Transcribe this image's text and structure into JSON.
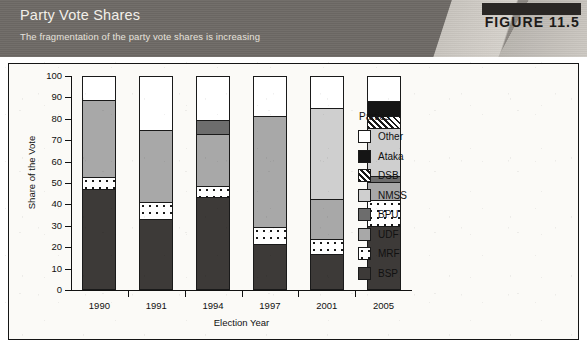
{
  "header": {
    "title": "Party Vote Shares",
    "subtitle": "The fragmentation of the party vote shares is increasing",
    "figure_label": "FIGURE 11.5",
    "band_color": "#6e6a66",
    "badge_color": "#2a2725"
  },
  "chart_data": {
    "type": "bar",
    "subtype": "stacked-bar-100",
    "title": "Party Vote Shares",
    "subtitle": "The fragmentation of the party vote shares is increasing",
    "xlabel": "Election Year",
    "ylabel": "Share of the Vote",
    "categories": [
      "1990",
      "1991",
      "1994",
      "1997",
      "2001",
      "2005"
    ],
    "ylim": [
      0,
      100
    ],
    "yticks": [
      0,
      10,
      20,
      30,
      40,
      50,
      60,
      70,
      80,
      90,
      100
    ],
    "grid": false,
    "legend_position": "right",
    "legend_title": "Parties",
    "stack_order_bottom_to_top": [
      "BSP",
      "MRF",
      "UDF",
      "BPU",
      "NMSS",
      "DSB",
      "Ataka",
      "Other"
    ],
    "series": [
      {
        "name": "BSP",
        "fill": "solid-dark-gray",
        "color": "#3d3a38",
        "values": [
          47,
          33,
          43.5,
          21.5,
          17,
          30
        ]
      },
      {
        "name": "MRF",
        "fill": "white-dots",
        "color": "#ffffff",
        "values": [
          6,
          8,
          5,
          8,
          7,
          12
        ]
      },
      {
        "name": "UDF",
        "fill": "solid-mid-gray",
        "color": "#a8a8a8",
        "values": [
          36,
          34,
          24.5,
          52,
          18.5,
          8.5
        ]
      },
      {
        "name": "BPU",
        "fill": "solid-dark-gray-2",
        "color": "#6d6d6d",
        "values": [
          0,
          0,
          6.5,
          0,
          0,
          3
        ]
      },
      {
        "name": "NMSS",
        "fill": "solid-light-gray",
        "color": "#cfcfcf",
        "values": [
          0,
          0,
          0,
          0,
          42.5,
          22
        ]
      },
      {
        "name": "DSB",
        "fill": "diagonal-hatch",
        "color": "#ffffff",
        "values": [
          0,
          0,
          0,
          0,
          0,
          6
        ]
      },
      {
        "name": "Ataka",
        "fill": "solid-black",
        "color": "#151515",
        "values": [
          0,
          0,
          0,
          0,
          0,
          7
        ]
      },
      {
        "name": "Other",
        "fill": "white",
        "color": "#ffffff",
        "values": [
          11,
          25,
          20.5,
          18.5,
          15,
          11.5
        ]
      }
    ]
  },
  "legend": {
    "title": "Parties",
    "items": [
      {
        "label": "Other",
        "key": "other"
      },
      {
        "label": "Ataka",
        "key": "ataka"
      },
      {
        "label": "DSB",
        "key": "dsb"
      },
      {
        "label": "NMSS",
        "key": "nmss"
      },
      {
        "label": "BPU",
        "key": "bpu"
      },
      {
        "label": "UDF",
        "key": "udf"
      },
      {
        "label": "MRF",
        "key": "mrf"
      },
      {
        "label": "BSP",
        "key": "bsp"
      }
    ]
  }
}
